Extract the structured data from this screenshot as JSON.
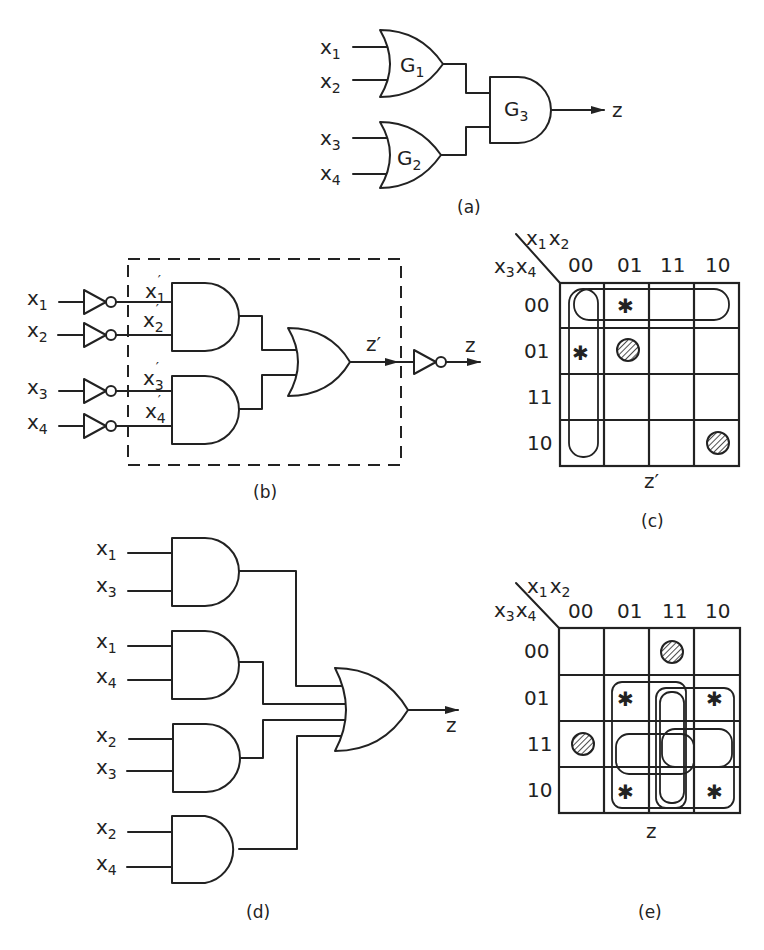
{
  "panels": {
    "a": {
      "caption": "(a)",
      "inputs": [
        "x",
        "x",
        "x",
        "x"
      ],
      "input_subs": [
        "1",
        "2",
        "3",
        "4"
      ],
      "gates": [
        {
          "name": "G",
          "sub": "1",
          "type": "OR"
        },
        {
          "name": "G",
          "sub": "2",
          "type": "OR"
        },
        {
          "name": "G",
          "sub": "3",
          "type": "AND"
        }
      ],
      "output": "z"
    },
    "b": {
      "caption": "(b)",
      "inputs": [
        "x",
        "x",
        "x",
        "x"
      ],
      "input_subs": [
        "1",
        "2",
        "3",
        "4"
      ],
      "inverted_labels": [
        "x",
        "x",
        "x",
        "x"
      ],
      "inverted_subs": [
        "1",
        "2",
        "3",
        "4"
      ],
      "prime": "′",
      "internal_output": "z′",
      "output": "z"
    },
    "c": {
      "caption": "(c)",
      "col_var": "x",
      "col_var_subs": [
        "1",
        "2"
      ],
      "row_var": "x",
      "row_var_subs": [
        "3",
        "4"
      ],
      "col_headers": [
        "00",
        "01",
        "11",
        "10"
      ],
      "row_headers": [
        "00",
        "01",
        "11",
        "10"
      ],
      "function_label": "z′",
      "cells": {
        "star": [
          [
            0,
            1
          ],
          [
            1,
            0
          ]
        ],
        "hatched": [
          [
            1,
            1
          ],
          [
            3,
            3
          ]
        ]
      }
    },
    "d": {
      "caption": "(d)",
      "and_gates": [
        {
          "in1": "x",
          "s1": "1",
          "in2": "x",
          "s2": "3"
        },
        {
          "in1": "x",
          "s1": "1",
          "in2": "x",
          "s2": "4"
        },
        {
          "in1": "x",
          "s1": "2",
          "in2": "x",
          "s2": "3"
        },
        {
          "in1": "x",
          "s1": "2",
          "in2": "x",
          "s2": "4"
        }
      ],
      "output": "z"
    },
    "e": {
      "caption": "(e)",
      "col_var": "x",
      "col_var_subs": [
        "1",
        "2"
      ],
      "row_var": "x",
      "row_var_subs": [
        "3",
        "4"
      ],
      "col_headers": [
        "00",
        "01",
        "11",
        "10"
      ],
      "row_headers": [
        "00",
        "01",
        "11",
        "10"
      ],
      "function_label": "z",
      "cells": {
        "star": [
          [
            1,
            1
          ],
          [
            1,
            3
          ],
          [
            3,
            1
          ],
          [
            3,
            3
          ]
        ],
        "hatched": [
          [
            0,
            2
          ],
          [
            2,
            0
          ]
        ]
      }
    }
  },
  "legend": {
    "star_icon": "asterisk",
    "hatched_icon": "hatched-circle"
  },
  "colors": {
    "ink": "#222222",
    "paper": "#ffffff"
  }
}
